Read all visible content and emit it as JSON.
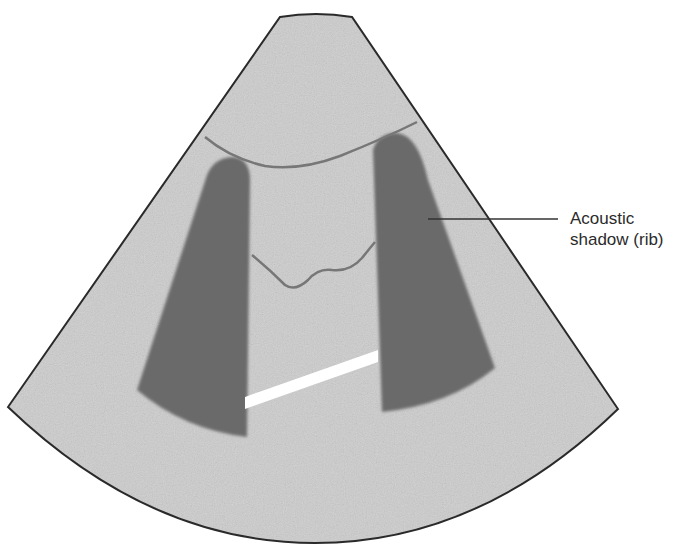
{
  "figure": {
    "type": "ultrasound-schematic",
    "annotations": [
      {
        "id": "acoustic-shadow",
        "lines": [
          "Acoustic",
          "shadow (rib)"
        ]
      }
    ]
  },
  "colors": {
    "background": "#ffffff",
    "sector_fill": "#cdcdcd",
    "sector_outline": "#2a2a2a",
    "shadow_fill": "#6b6b6b",
    "pleural_line": "#777777",
    "bright_band": "#ffffff",
    "leader_line": "#333333",
    "label_text": "#2b2b2b"
  }
}
